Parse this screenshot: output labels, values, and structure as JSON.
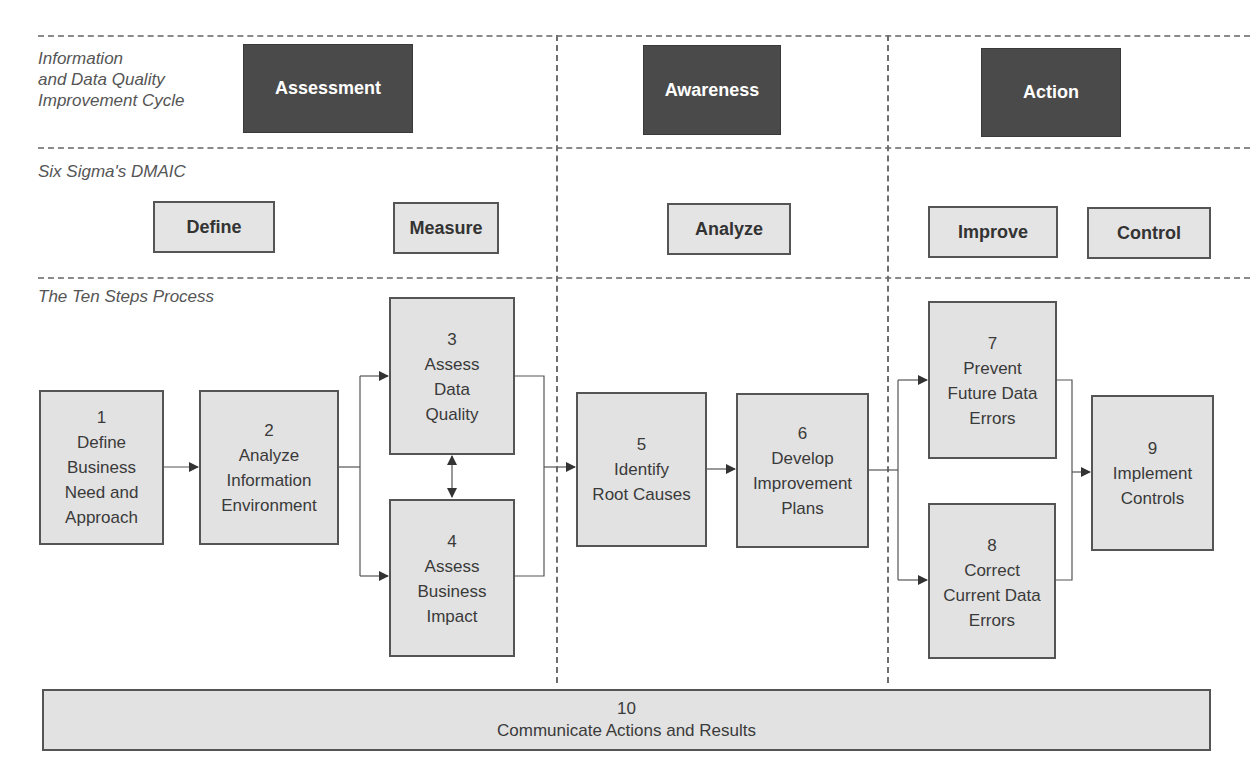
{
  "rows": {
    "cycle_label": "Information\nand Data Quality\nImprovement Cycle",
    "dmaic_label": "Six Sigma's DMAIC",
    "ten_steps_label": "The Ten Steps Process"
  },
  "cycle_phases": [
    {
      "label": "Assessment"
    },
    {
      "label": "Awareness"
    },
    {
      "label": "Action"
    }
  ],
  "dmaic": [
    {
      "label": "Define"
    },
    {
      "label": "Measure"
    },
    {
      "label": "Analyze"
    },
    {
      "label": "Improve"
    },
    {
      "label": "Control"
    }
  ],
  "steps": [
    {
      "num": "1",
      "text": "Define\nBusiness\nNeed and\nApproach"
    },
    {
      "num": "2",
      "text": "Analyze\nInformation\nEnvironment"
    },
    {
      "num": "3",
      "text": "Assess\nData\nQuality"
    },
    {
      "num": "4",
      "text": "Assess\nBusiness\nImpact"
    },
    {
      "num": "5",
      "text": "Identify\nRoot Causes"
    },
    {
      "num": "6",
      "text": "Develop\nImprovement\nPlans"
    },
    {
      "num": "7",
      "text": "Prevent\nFuture Data\nErrors"
    },
    {
      "num": "8",
      "text": "Correct\nCurrent Data\nErrors"
    },
    {
      "num": "9",
      "text": "Implement\nControls"
    },
    {
      "num": "10",
      "text": "Communicate Actions and Results"
    }
  ],
  "colors": {
    "phase_box": "#4a4a4a",
    "step_box": "#e2e2e2",
    "border": "#555555",
    "divider": "#8a8a8a"
  }
}
